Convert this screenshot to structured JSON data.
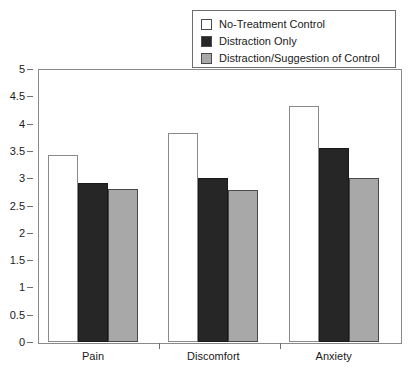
{
  "chart_data": {
    "type": "bar",
    "title": "",
    "subtitle": "",
    "xlabel": "",
    "ylabel": "",
    "categories": [
      "Pain",
      "Discomfort",
      "Anxiety"
    ],
    "series": [
      {
        "name": "No-Treatment Control",
        "values": [
          3.42,
          3.82,
          4.33
        ],
        "color": "#ffffff"
      },
      {
        "name": "Distraction Only",
        "values": [
          2.92,
          3.0,
          3.55
        ],
        "color": "#262626"
      },
      {
        "name": "Distraction/Suggestion of Control",
        "values": [
          2.8,
          2.78,
          3.0
        ],
        "color": "#a8a8a8"
      }
    ],
    "ylim": [
      0,
      5
    ],
    "yticks": [
      "0",
      "0.5",
      "1",
      "1.5",
      "2",
      "2.5",
      "3",
      "3.5",
      "4",
      "4.5",
      "5"
    ],
    "ytick_values": [
      0,
      0.5,
      1,
      1.5,
      2,
      2.5,
      3,
      3.5,
      4,
      4.5,
      5
    ],
    "grid": false,
    "legend_position": "top-right",
    "frame": true
  },
  "legend": {
    "entries": [
      {
        "label": "No-Treatment Control",
        "swatch": "legend-swatch-no-treatment-control"
      },
      {
        "label": "Distraction Only",
        "swatch": "legend-swatch-distraction-only"
      },
      {
        "label": "Distraction/Suggestion of Control",
        "swatch": "legend-swatch-distraction-suggestion"
      }
    ]
  },
  "colors": {
    "series_0": "#ffffff",
    "series_1": "#262626",
    "series_2": "#a8a8a8",
    "axis": "#8a8a8a",
    "tick": "#6e6e6e",
    "text": "#1a1a1a",
    "background": "#ffffff"
  }
}
